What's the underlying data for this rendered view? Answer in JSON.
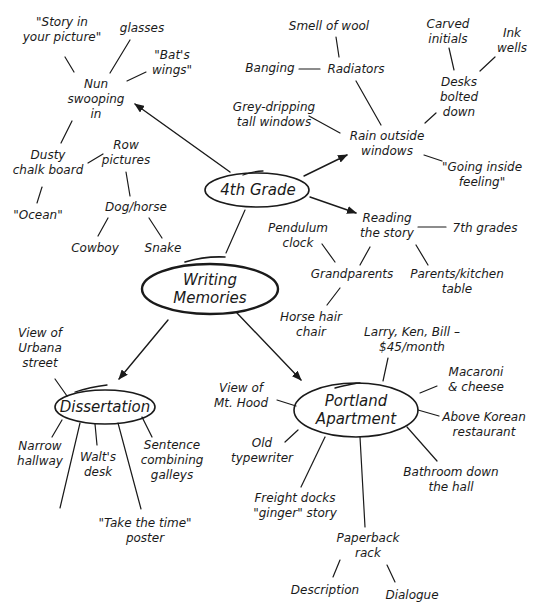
{
  "title": "Writing Memories",
  "center": {
    "lines": [
      "Writing",
      "Memories"
    ]
  },
  "hubs": {
    "fourth_grade": {
      "label": "4th Grade"
    },
    "dissertation": {
      "label": "Dissertation"
    },
    "portland": {
      "lines": [
        "Portland",
        "Apartment"
      ]
    }
  },
  "nodes": {
    "story_in_picture": {
      "lines": [
        "\"Story in",
        "your picture\""
      ]
    },
    "glasses": {
      "lines": [
        "glasses"
      ]
    },
    "bats_wings": {
      "lines": [
        "\"Bat's",
        "wings\""
      ]
    },
    "nun": {
      "lines": [
        "Nun",
        "swooping",
        "in"
      ]
    },
    "dusty_chalk": {
      "lines": [
        "Dusty",
        "chalk board"
      ]
    },
    "ocean": {
      "lines": [
        "\"Ocean\""
      ]
    },
    "row_pictures": {
      "lines": [
        "Row",
        "pictures"
      ]
    },
    "dog_horse": {
      "lines": [
        "Dog/horse"
      ]
    },
    "cowboy": {
      "lines": [
        "Cowboy"
      ]
    },
    "snake": {
      "lines": [
        "Snake"
      ]
    },
    "smell_wool": {
      "lines": [
        "Smell of wool"
      ]
    },
    "banging": {
      "lines": [
        "Banging"
      ]
    },
    "radiators": {
      "lines": [
        "Radiators"
      ]
    },
    "carved_initials": {
      "lines": [
        "Carved",
        "initials"
      ]
    },
    "ink_wells": {
      "lines": [
        "Ink",
        "wells"
      ]
    },
    "desks": {
      "lines": [
        "Desks",
        "bolted",
        "down"
      ]
    },
    "grey_dripping": {
      "lines": [
        "Grey-dripping",
        "tall windows"
      ]
    },
    "rain": {
      "lines": [
        "Rain outside",
        "windows"
      ]
    },
    "going_inside": {
      "lines": [
        "\"Going inside",
        "feeling\""
      ]
    },
    "reading_story": {
      "lines": [
        "Reading",
        "the story"
      ]
    },
    "seventh_grades": {
      "lines": [
        "7th grades"
      ]
    },
    "pendulum": {
      "lines": [
        "Pendulum",
        "clock"
      ]
    },
    "grandparents": {
      "lines": [
        "Grandparents"
      ]
    },
    "parents_kitchen": {
      "lines": [
        "Parents/kitchen",
        "table"
      ]
    },
    "horse_hair": {
      "lines": [
        "Horse hair",
        "chair"
      ]
    },
    "view_urbana": {
      "lines": [
        "View of",
        "Urbana",
        "street"
      ]
    },
    "narrow_hallway": {
      "lines": [
        "Narrow",
        "hallway"
      ]
    },
    "walts_desk": {
      "lines": [
        "Walt's",
        "desk"
      ]
    },
    "sentence_combining": {
      "lines": [
        "Sentence",
        "combining",
        "galleys"
      ]
    },
    "take_the_time": {
      "lines": [
        "\"Take the time\"",
        "poster"
      ]
    },
    "larry_ken_bill": {
      "lines": [
        "Larry, Ken, Bill –",
        "$45/month"
      ]
    },
    "macaroni": {
      "lines": [
        "Macaroni",
        "& cheese"
      ]
    },
    "view_mt_hood": {
      "lines": [
        "View of",
        "Mt. Hood"
      ]
    },
    "above_korean": {
      "lines": [
        "Above Korean",
        "restaurant"
      ]
    },
    "old_typewriter": {
      "lines": [
        "Old",
        "typewriter"
      ]
    },
    "bathroom": {
      "lines": [
        "Bathroom down",
        "the hall"
      ]
    },
    "freight_docks": {
      "lines": [
        "Freight docks",
        "\"ginger\" story"
      ]
    },
    "paperback": {
      "lines": [
        "Paperback",
        "rack"
      ]
    },
    "description": {
      "lines": [
        "Description"
      ]
    },
    "dialogue": {
      "lines": [
        "Dialogue"
      ]
    }
  },
  "colors": {
    "ink": "#1a1a1a",
    "background": "#ffffff"
  }
}
